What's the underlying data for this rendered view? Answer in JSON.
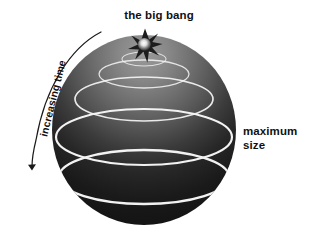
{
  "figure": {
    "title_label": "the big bang",
    "time_label": "increasing time",
    "size_label": "maximum\nsize",
    "background_color": "#ffffff",
    "text_color": "#111111",
    "ring_color": "#f2f2f2",
    "arrow_color": "#1a1a1a",
    "sphere": {
      "center_x": 144,
      "center_y": 130,
      "radius_x": 92,
      "radius_y": 95,
      "top_color": "#909090",
      "mid_color": "#4a4a4a",
      "bottom_color": "#121212"
    },
    "burst": {
      "name": "big-bang-starburst",
      "center_x": 145,
      "center_y": 46,
      "points": 8,
      "outer_radius": 17,
      "inner_radius": 7,
      "core_color": "#f0f0f0",
      "spike_color": "#1c1c1c"
    },
    "latitude_rings": [
      {
        "name": "ring-1",
        "cy": 59,
        "rx": 22,
        "ry": 7
      },
      {
        "name": "ring-2",
        "cy": 74,
        "rx": 45,
        "ry": 14
      },
      {
        "name": "ring-3",
        "cy": 99,
        "rx": 69,
        "ry": 22
      },
      {
        "name": "ring-4",
        "cy": 137,
        "rx": 88,
        "ry": 28
      },
      {
        "name": "ring-5",
        "cy": 177,
        "rx": 85,
        "ry": 27
      }
    ],
    "time_arrow": {
      "name": "increasing-time-arrow",
      "path": "M 101 32 C 70 48 45 88 36 140 C 33 152 32 160 32 166",
      "head_x": 33,
      "head_y": 178
    }
  }
}
